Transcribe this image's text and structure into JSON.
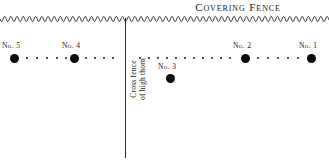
{
  "diagram": {
    "title": "Covering Fence",
    "cross_fence": {
      "line_1": "Cross fence",
      "line_2": "of high thorn"
    },
    "markers": [
      {
        "id": "no-5",
        "label": "No. 5",
        "x": 14,
        "y": 58,
        "label_x": 2,
        "label_y": 41
      },
      {
        "id": "no-4",
        "label": "No. 4",
        "x": 74,
        "y": 58,
        "label_x": 62,
        "label_y": 41
      },
      {
        "id": "no-3",
        "label": "No. 3",
        "x": 170,
        "y": 78,
        "label_x": 158,
        "label_y": 62
      },
      {
        "id": "no-2",
        "label": "No. 2",
        "x": 245,
        "y": 58,
        "label_x": 233,
        "label_y": 41
      },
      {
        "id": "no-1",
        "label": "No. 1",
        "x": 311,
        "y": 58,
        "label_x": 299,
        "label_y": 41
      }
    ],
    "trail_dots": [
      {
        "x": 27,
        "y": 58
      },
      {
        "x": 37,
        "y": 58
      },
      {
        "x": 47,
        "y": 58
      },
      {
        "x": 57,
        "y": 58
      },
      {
        "x": 66,
        "y": 58
      },
      {
        "x": 86,
        "y": 58
      },
      {
        "x": 95,
        "y": 58
      },
      {
        "x": 104,
        "y": 58
      },
      {
        "x": 113,
        "y": 58
      },
      {
        "x": 140,
        "y": 58
      },
      {
        "x": 149,
        "y": 58
      },
      {
        "x": 158,
        "y": 58
      },
      {
        "x": 167,
        "y": 58
      },
      {
        "x": 176,
        "y": 58
      },
      {
        "x": 185,
        "y": 58
      },
      {
        "x": 194,
        "y": 58
      },
      {
        "x": 203,
        "y": 58
      },
      {
        "x": 212,
        "y": 58
      },
      {
        "x": 221,
        "y": 58
      },
      {
        "x": 230,
        "y": 58
      },
      {
        "x": 258,
        "y": 58
      },
      {
        "x": 268,
        "y": 58
      },
      {
        "x": 278,
        "y": 58
      },
      {
        "x": 288,
        "y": 58
      },
      {
        "x": 298,
        "y": 58
      }
    ],
    "colors": {
      "ink": "#111111",
      "dot": "#0c0c0e",
      "fence_line": "#2b2b2e",
      "paper": "#ffffff"
    }
  }
}
